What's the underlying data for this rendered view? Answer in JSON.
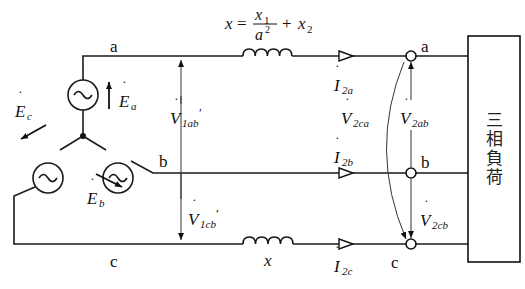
{
  "formula": {
    "lhs": "x",
    "equals": "=",
    "numerator": "x",
    "numerator_sub": "1",
    "denominator": "a",
    "denominator_sup": "2",
    "plus": "+",
    "term2": "x",
    "term2_sub": "2"
  },
  "lines": {
    "a_left": "a",
    "b_left": "b",
    "c_left": "c",
    "a_right": "a",
    "b_right": "b",
    "c_right": "c"
  },
  "sources": {
    "Ea": {
      "symbol": "E",
      "sub": "a"
    },
    "Eb": {
      "symbol": "E",
      "sub": "b"
    },
    "Ec": {
      "symbol": "E",
      "sub": "c"
    }
  },
  "voltages": {
    "V1ab": {
      "symbol": "V",
      "sub": "1ab",
      "prime": "′"
    },
    "V1cb": {
      "symbol": "V",
      "sub": "1cb",
      "prime": "′"
    },
    "V2ab": {
      "symbol": "V",
      "sub": "2ab"
    },
    "V2cb": {
      "symbol": "V",
      "sub": "2cb"
    },
    "V2ca": {
      "symbol": "V",
      "sub": "2ca"
    }
  },
  "currents": {
    "I2a": {
      "symbol": "I",
      "sub": "2a"
    },
    "I2b": {
      "symbol": "I",
      "sub": "2b"
    },
    "I2c": {
      "symbol": "I",
      "sub": "2c"
    }
  },
  "reactance_c_label": "x",
  "load": {
    "label": "三相負荷"
  },
  "dot": "˙",
  "colors": {
    "line": "#1a1a1a",
    "background": "#ffffff"
  }
}
